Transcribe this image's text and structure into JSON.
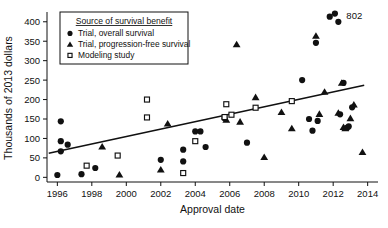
{
  "chart_data": {
    "type": "scatter",
    "title": "",
    "xlabel": "Approval date",
    "ylabel": "Thousands of 2013 dollars",
    "xlim": [
      1995.4,
      2014.6
    ],
    "ylim": [
      -12,
      420
    ],
    "xticks": [
      1996,
      1998,
      2000,
      2002,
      2004,
      2006,
      2008,
      2010,
      2012,
      2014
    ],
    "yticks": [
      0,
      50,
      100,
      150,
      200,
      250,
      300,
      350,
      400
    ],
    "grid": false,
    "legend": {
      "position": "upper-left",
      "title": "Source of survival benefit",
      "entries": [
        {
          "label": "Trial, overall survival",
          "marker": "filled-circle"
        },
        {
          "label": "Trial, progression-free survival",
          "marker": "filled-triangle"
        },
        {
          "label": "Modeling study",
          "marker": "open-square"
        }
      ]
    },
    "annotations": [
      {
        "text": "802",
        "x": 2012.3,
        "y": 418,
        "note": "value label for off-scale point"
      }
    ],
    "trendline": {
      "type": "linear",
      "x_start": 1995.5,
      "y_start": 62,
      "x_end": 2013.8,
      "y_end": 237
    },
    "series": [
      {
        "name": "Trial, overall survival",
        "marker": "filled-circle",
        "points": [
          [
            1996.0,
            6
          ],
          [
            1996.2,
            144
          ],
          [
            1996.2,
            93
          ],
          [
            1996.2,
            67
          ],
          [
            1996.6,
            84
          ],
          [
            1997.4,
            8
          ],
          [
            1998.2,
            24
          ],
          [
            2002.0,
            45
          ],
          [
            2003.3,
            71
          ],
          [
            2003.3,
            41
          ],
          [
            2004.0,
            118
          ],
          [
            2004.3,
            118
          ],
          [
            2004.6,
            78
          ],
          [
            2005.7,
            152
          ],
          [
            2007.0,
            89
          ],
          [
            2010.2,
            250
          ],
          [
            2010.6,
            150
          ],
          [
            2010.8,
            120
          ],
          [
            2011.0,
            346
          ],
          [
            2011.1,
            145
          ],
          [
            2011.8,
            413
          ],
          [
            2012.1,
            421
          ],
          [
            2012.3,
            400
          ],
          [
            2012.4,
            162
          ],
          [
            2012.6,
            243
          ],
          [
            2012.8,
            127
          ],
          [
            2012.9,
            131
          ],
          [
            2013.1,
            180
          ]
        ]
      },
      {
        "name": "Trial, progression-free survival",
        "marker": "filled-triangle",
        "points": [
          [
            1998.6,
            79
          ],
          [
            1999.6,
            7
          ],
          [
            2002.0,
            20
          ],
          [
            2002.4,
            138
          ],
          [
            2005.8,
            148
          ],
          [
            2006.4,
            342
          ],
          [
            2006.6,
            143
          ],
          [
            2007.5,
            206
          ],
          [
            2008.0,
            52
          ],
          [
            2009.0,
            168
          ],
          [
            2009.6,
            126
          ],
          [
            2011.0,
            364
          ],
          [
            2011.2,
            163
          ],
          [
            2011.5,
            220
          ],
          [
            2012.3,
            166
          ],
          [
            2012.5,
            243
          ],
          [
            2012.6,
            129
          ],
          [
            2012.7,
            126
          ],
          [
            2013.0,
            152
          ],
          [
            2013.2,
            187
          ],
          [
            2013.7,
            65
          ]
        ]
      },
      {
        "name": "Modeling study",
        "marker": "open-square",
        "points": [
          [
            1997.7,
            30
          ],
          [
            1999.5,
            56
          ],
          [
            2001.2,
            200
          ],
          [
            2001.2,
            154
          ],
          [
            2003.3,
            11
          ],
          [
            2004.0,
            93
          ],
          [
            2005.7,
            155
          ],
          [
            2005.8,
            188
          ],
          [
            2006.1,
            161
          ],
          [
            2007.5,
            179
          ],
          [
            2009.6,
            196
          ]
        ]
      }
    ]
  }
}
